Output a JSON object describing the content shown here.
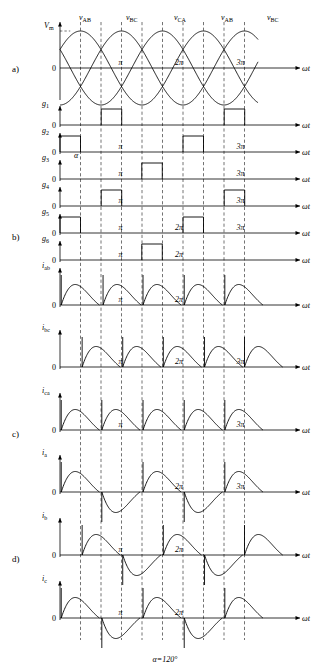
{
  "figure": {
    "caption": "α=120°",
    "axis_label_omega_t": "ωt",
    "zero_label": "0",
    "vm_label": "V",
    "vm_sub": "m",
    "alpha_label": "α"
  },
  "row_labels": {
    "a": "a)",
    "b": "b)",
    "c": "c)",
    "d": "d)"
  },
  "top_voltage_labels": [
    {
      "base": "v",
      "sub": "AB",
      "x": 86
    },
    {
      "base": "v",
      "sub": "BC",
      "x": 133
    },
    {
      "base": "v",
      "sub": "CA",
      "x": 181
    },
    {
      "base": "v",
      "sub": "AB",
      "x": 228
    },
    {
      "base": "v",
      "sub": "BC",
      "x": 274
    }
  ],
  "signal_labels": [
    {
      "base": "g",
      "sub": "1"
    },
    {
      "base": "g",
      "sub": "2"
    },
    {
      "base": "g",
      "sub": "3"
    },
    {
      "base": "g",
      "sub": "4"
    },
    {
      "base": "g",
      "sub": "5"
    },
    {
      "base": "g",
      "sub": "6"
    },
    {
      "base": "i",
      "sub": "ab"
    },
    {
      "base": "i",
      "sub": "bc"
    },
    {
      "base": "i",
      "sub": "ca"
    },
    {
      "base": "i",
      "sub": "a"
    },
    {
      "base": "i",
      "sub": "b"
    },
    {
      "base": "i",
      "sub": "c"
    }
  ],
  "x_ticks": [
    {
      "label": "π",
      "x": 147
    },
    {
      "label": "2π",
      "x": 208
    },
    {
      "label": "3π",
      "x": 270
    }
  ],
  "chart_data": {
    "type": "line",
    "xlabel": "ωt",
    "ylabel": "",
    "x_tick_labels": [
      "0",
      "π",
      "2π",
      "3π"
    ],
    "series": [
      {
        "name": "v_AB",
        "type": "sine"
      },
      {
        "name": "v_BC",
        "type": "sine"
      },
      {
        "name": "v_CA",
        "type": "sine"
      },
      {
        "name": "g1",
        "type": "pulse"
      },
      {
        "name": "g2",
        "type": "pulse"
      },
      {
        "name": "g3",
        "type": "pulse"
      },
      {
        "name": "g4",
        "type": "pulse"
      },
      {
        "name": "g5",
        "type": "pulse"
      },
      {
        "name": "g6",
        "type": "pulse"
      },
      {
        "name": "i_ab",
        "type": "current"
      },
      {
        "name": "i_bc",
        "type": "current"
      },
      {
        "name": "i_ca",
        "type": "current"
      },
      {
        "name": "i_a",
        "type": "current"
      },
      {
        "name": "i_b",
        "type": "current"
      },
      {
        "name": "i_c",
        "type": "current"
      }
    ]
  }
}
